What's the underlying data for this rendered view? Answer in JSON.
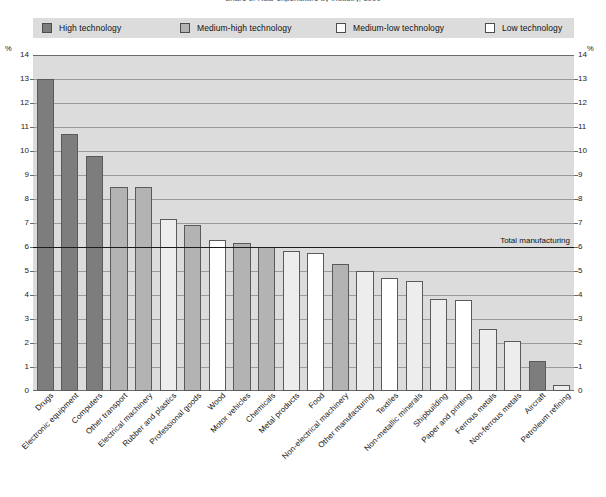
{
  "chart": {
    "title": "Share of R&D expenditure by industry, 1999",
    "axis_unit": "%",
    "reference_line_label": "Total manufacturing",
    "reference_line_value": 6.0
  },
  "legend": {
    "position": "top",
    "items": [
      {
        "label": "High technology",
        "key": "high",
        "color": "#7d7d7d"
      },
      {
        "label": "Medium-high technology",
        "key": "medhigh",
        "color": "#b3b3b3"
      },
      {
        "label": "Medium-low technology",
        "key": "medlow",
        "color": "#ededed"
      },
      {
        "label": "Low technology",
        "key": "low",
        "color": "#ffffff"
      }
    ]
  },
  "chart_data": {
    "type": "bar",
    "title": "Share of R&D expenditure by industry, 1999",
    "xlabel": "",
    "ylabel": "%",
    "ylim": [
      0,
      14
    ],
    "yticks": [
      0,
      1,
      2,
      3,
      4,
      5,
      6,
      7,
      8,
      9,
      10,
      11,
      12,
      13,
      14
    ],
    "grid": true,
    "legend_position": "top",
    "reference_line": {
      "value": 6.0,
      "label": "Total manufacturing"
    },
    "categories": [
      "Drugs",
      "Electronic equipment",
      "Computers",
      "Other transport",
      "Electrical machinery",
      "Rubber and plastics",
      "Professional goods",
      "Wood",
      "Motor vehicles",
      "Chemicals",
      "Metal products",
      "Food",
      "Non-electrical machinery",
      "Other manufacturing",
      "Textiles",
      "Non-metallic minerals",
      "Shipbuilding",
      "Paper and printing",
      "Ferrous metals",
      "Non-ferrous metals",
      "Aircraft",
      "Petroleum refining"
    ],
    "values": [
      13.0,
      10.7,
      9.8,
      8.5,
      8.5,
      7.15,
      6.9,
      6.3,
      6.15,
      6.0,
      5.85,
      5.75,
      5.3,
      5.0,
      4.7,
      4.6,
      3.85,
      3.8,
      2.6,
      2.1,
      1.25,
      0.25
    ],
    "groups": [
      "high",
      "high",
      "high",
      "medhigh",
      "medhigh",
      "medlow",
      "medhigh",
      "low",
      "medhigh",
      "medhigh",
      "medlow",
      "low",
      "medhigh",
      "medlow",
      "low",
      "medlow",
      "medlow",
      "low",
      "medlow",
      "medlow",
      "high",
      "medlow"
    ]
  }
}
